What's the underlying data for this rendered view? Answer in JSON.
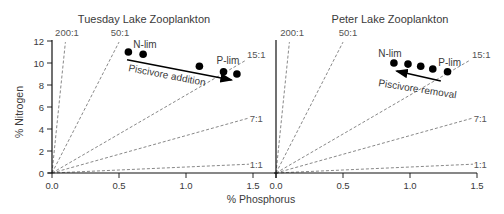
{
  "figure": {
    "xlabel": "% Phosphorus",
    "ylabel": "% Nitrogen",
    "colors": {
      "points": "#000000",
      "ratio_lines": "#6a6a6a",
      "axes": "#111111",
      "text": "#3a3a3a"
    }
  },
  "chart_data": [
    {
      "type": "scatter",
      "title": "Tuesday Lake Zooplankton",
      "xlabel": "% Phosphorus",
      "ylabel": "% Nitrogen",
      "xlim": [
        0,
        1.5
      ],
      "ylim": [
        0,
        12
      ],
      "xticks": [
        {
          "value": 0.0,
          "label": "0.0"
        },
        {
          "value": 0.5,
          "label": "0.5"
        },
        {
          "value": 1.0,
          "label": "1.0"
        },
        {
          "value": 1.5,
          "label": "1.5"
        }
      ],
      "yticks": [
        {
          "value": 0,
          "label": "0"
        },
        {
          "value": 2,
          "label": "2"
        },
        {
          "value": 4,
          "label": "4"
        },
        {
          "value": 6,
          "label": "6"
        },
        {
          "value": 8,
          "label": "8"
        },
        {
          "value": 10,
          "label": "10"
        },
        {
          "value": 12,
          "label": "12"
        }
      ],
      "grid": false,
      "series": [
        {
          "name": "Zooplankton N:P",
          "points": [
            [
              0.57,
              11.0
            ],
            [
              0.68,
              10.8
            ],
            [
              1.1,
              9.7
            ],
            [
              1.28,
              9.2
            ],
            [
              1.38,
              9.0
            ]
          ]
        }
      ],
      "ratio_lines": [
        {
          "label": "200:1",
          "end": [
            0.1,
            11.9
          ],
          "label_pos": [
            0.112,
            12.45
          ],
          "anchor": "middle"
        },
        {
          "label": "50:1",
          "end": [
            0.5,
            11.9
          ],
          "label_pos": [
            0.507,
            12.45
          ],
          "anchor": "middle"
        },
        {
          "label": "15:1",
          "end": [
            1.44,
            10.2
          ],
          "label_pos": [
            1.455,
            10.45
          ],
          "anchor": "start"
        },
        {
          "label": "7:1",
          "end": [
            1.47,
            5.0
          ],
          "label_pos": [
            1.475,
            4.64
          ],
          "anchor": "start"
        },
        {
          "label": "1:1",
          "end": [
            1.47,
            0.8
          ],
          "label_pos": [
            1.475,
            0.45
          ],
          "anchor": "start"
        }
      ],
      "annotations": [
        {
          "text": "N-lim",
          "pos": [
            0.694,
            11.36
          ]
        },
        {
          "text": "P-lim",
          "pos": [
            1.313,
            9.9
          ]
        }
      ],
      "arrow": {
        "label": "Piscivore addition",
        "from": [
          0.56,
          10.3
        ],
        "to": [
          1.34,
          8.45
        ],
        "label_pos": [
          0.567,
          9.27
        ],
        "label_rotate": 11
      }
    },
    {
      "type": "scatter",
      "title": "Peter Lake Zooplankton",
      "xlabel": "% Phosphorus",
      "ylabel": "% Nitrogen",
      "xlim": [
        0,
        1.5
      ],
      "ylim": [
        0,
        12
      ],
      "xticks": [
        {
          "value": 0.0,
          "label": "0.0"
        },
        {
          "value": 0.5,
          "label": "0.5"
        },
        {
          "value": 1.0,
          "label": "1.0"
        },
        {
          "value": 1.5,
          "label": "1.5"
        }
      ],
      "yticks": [],
      "grid": false,
      "series": [
        {
          "name": "Zooplankton N:P",
          "points": [
            [
              0.88,
              10.0
            ],
            [
              0.985,
              9.9
            ],
            [
              1.08,
              9.7
            ],
            [
              1.17,
              9.45
            ],
            [
              1.28,
              9.2
            ]
          ]
        }
      ],
      "ratio_lines": [
        {
          "label": "200:1",
          "end": [
            0.1,
            11.9
          ],
          "label_pos": [
            0.12,
            12.45
          ],
          "anchor": "middle"
        },
        {
          "label": "50:1",
          "end": [
            0.5,
            11.9
          ],
          "label_pos": [
            0.537,
            12.45
          ],
          "anchor": "middle"
        },
        {
          "label": "15:1",
          "end": [
            1.44,
            10.2
          ],
          "label_pos": [
            1.463,
            10.45
          ],
          "anchor": "start"
        },
        {
          "label": "7:1",
          "end": [
            1.47,
            5.0
          ],
          "label_pos": [
            1.475,
            4.64
          ],
          "anchor": "start"
        },
        {
          "label": "1:1",
          "end": [
            1.47,
            0.8
          ],
          "label_pos": [
            1.475,
            0.45
          ],
          "anchor": "start"
        }
      ],
      "annotations": [
        {
          "text": "N-lim",
          "pos": [
            0.85,
            10.55
          ]
        },
        {
          "text": "P-lim",
          "pos": [
            1.296,
            9.73
          ]
        }
      ],
      "arrow": {
        "label": "Piscivore removal",
        "from": [
          1.23,
          8.36
        ],
        "to": [
          0.9,
          9.27
        ],
        "label_pos": [
          0.761,
          7.9
        ],
        "label_rotate": 9
      }
    }
  ]
}
